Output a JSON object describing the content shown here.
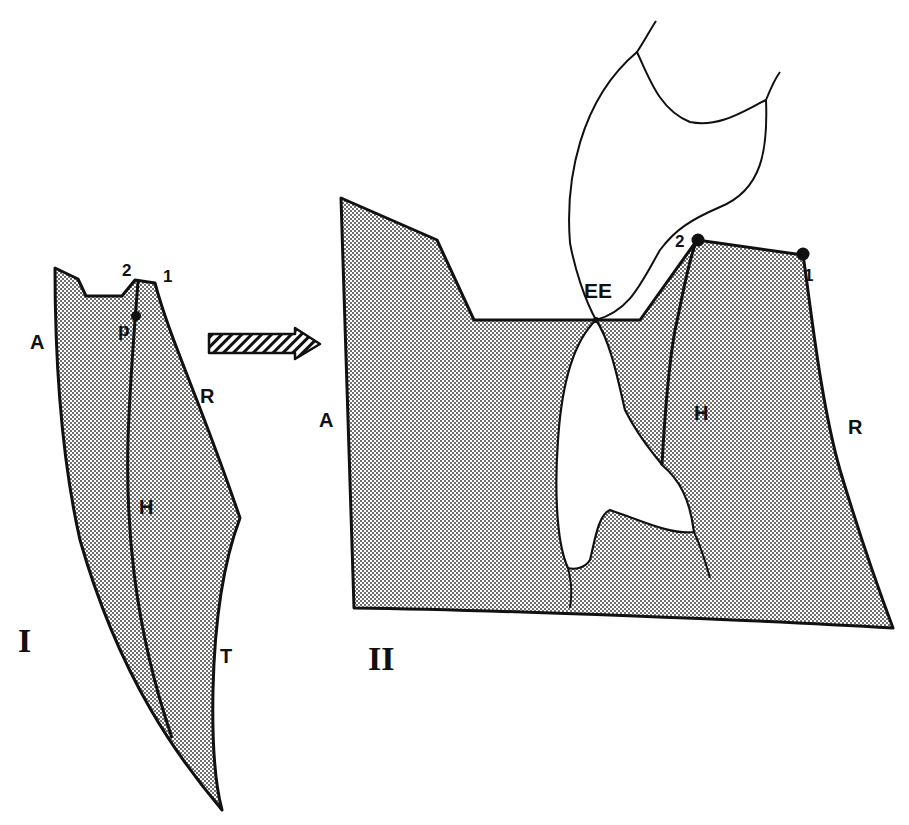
{
  "figure_I": {
    "numeral": "I",
    "labels": {
      "A": "A",
      "R": "R",
      "T": "T",
      "H": "H",
      "p": "p",
      "p1": "1",
      "p2": "2"
    }
  },
  "figure_II": {
    "numeral": "II",
    "labels": {
      "A": "A",
      "R": "R",
      "H": "H",
      "EE": "EE",
      "p1": "1",
      "p2": "2"
    }
  },
  "arrow": {
    "direction": "right",
    "fill": "hatched"
  },
  "colors": {
    "ink": "#111111",
    "stipple": "#bdbdbd",
    "background": "#ffffff"
  }
}
